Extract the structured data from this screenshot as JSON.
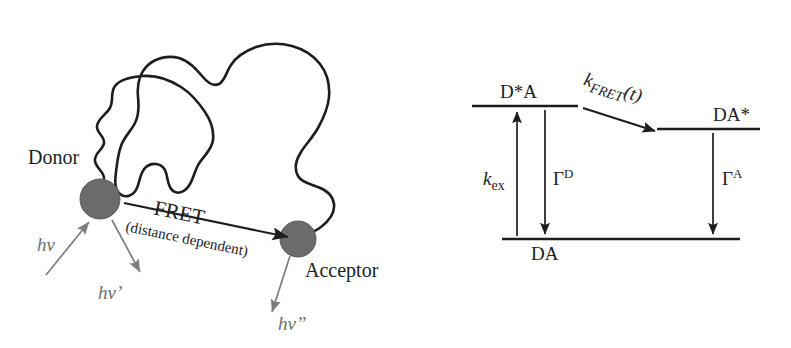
{
  "figure": {
    "type": "scientific-diagram",
    "background_color": "#ffffff",
    "panels": [
      "fret-molecular-schematic",
      "energy-level-diagram"
    ]
  },
  "colors": {
    "chromophore_fill": "#6b6b6b",
    "chromophore_stroke": "#5a5a5a",
    "chain_stroke": "#1d1d1d",
    "dark_text": "#1d1d1d",
    "gray_text": "#6f6f6f",
    "gray_arrow": "#7d7d7d",
    "level_line": "#1d1d1d"
  },
  "left_panel": {
    "name": "fret-molecular-schematic",
    "donor": {
      "label": "Donor",
      "marker": "filled-circle",
      "cx": 100,
      "cy": 199,
      "r": 20
    },
    "acceptor": {
      "label": "Acceptor",
      "marker": "filled-circle",
      "cx": 298,
      "cy": 239,
      "r": 18
    },
    "transfer_arrow": {
      "label": "FRET",
      "sublabel": "(distance dependent)",
      "direction": "donor-to-acceptor",
      "rotation_deg": 12
    },
    "photons": [
      {
        "id": "absorption",
        "label": "hv",
        "direction": "into-donor",
        "meaning": "excitation photon absorbed by donor"
      },
      {
        "id": "donor-emission",
        "label": "hv'",
        "direction": "out-of-donor",
        "meaning": "donor fluorescence photon"
      },
      {
        "id": "acceptor-emission",
        "label": "hv”",
        "direction": "out-of-acceptor",
        "meaning": "acceptor fluorescence photon"
      }
    ],
    "polymer_chain": "random-coil linker connecting donor and acceptor"
  },
  "right_panel": {
    "name": "energy-level-diagram",
    "levels": [
      {
        "id": "excited-donor",
        "label": "D*A",
        "label_position": "above",
        "x1": 472,
        "x2": 578,
        "y": 106
      },
      {
        "id": "excited-acceptor",
        "label": "DA*",
        "label_position": "above",
        "x1": 657,
        "x2": 760,
        "y": 129
      },
      {
        "id": "ground",
        "label": "DA",
        "label_position": "below",
        "x1": 502,
        "x2": 740,
        "y": 239
      }
    ],
    "transitions": [
      {
        "id": "excitation",
        "label": "k",
        "sub": "ex",
        "sup": "",
        "italic_base": true,
        "direction": "up",
        "from": "DA",
        "to": "D*A"
      },
      {
        "id": "donor-decay",
        "label": "Γ",
        "sub": "",
        "sup": "D",
        "italic_base": false,
        "direction": "down",
        "from": "D*A",
        "to": "DA"
      },
      {
        "id": "energy-transfer",
        "label": "k",
        "sub": "FRET",
        "suffix": "(t)",
        "italic_base": true,
        "direction": "diagonal-down-right",
        "from": "D*A",
        "to": "DA*"
      },
      {
        "id": "acceptor-decay",
        "label": "Γ",
        "sub": "",
        "sup": "A",
        "italic_base": false,
        "direction": "down",
        "from": "DA*",
        "to": "DA"
      }
    ]
  }
}
